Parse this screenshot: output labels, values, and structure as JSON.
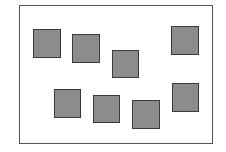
{
  "diagram": {
    "frame": {
      "x": 19,
      "y": 5,
      "width": 194,
      "height": 139,
      "border_color": "#555555"
    },
    "square_style": {
      "fill": "#8c8c8c",
      "border": "#3a3a3a"
    },
    "squares": [
      {
        "x": 33,
        "y": 29,
        "w": 28,
        "h": 29
      },
      {
        "x": 72,
        "y": 34,
        "w": 28,
        "h": 29
      },
      {
        "x": 112,
        "y": 50,
        "w": 27,
        "h": 28
      },
      {
        "x": 171,
        "y": 26,
        "w": 28,
        "h": 29
      },
      {
        "x": 54,
        "y": 89,
        "w": 27,
        "h": 29
      },
      {
        "x": 93,
        "y": 95,
        "w": 27,
        "h": 28
      },
      {
        "x": 132,
        "y": 100,
        "w": 28,
        "h": 29
      },
      {
        "x": 172,
        "y": 83,
        "w": 27,
        "h": 29
      }
    ]
  }
}
